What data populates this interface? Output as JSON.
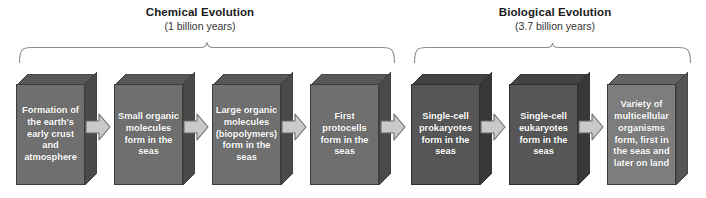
{
  "diagram": {
    "phases": [
      {
        "id": "chemical",
        "title": "Chemical Evolution",
        "duration": "(1 billion years)"
      },
      {
        "id": "biological",
        "title": "Biological Evolution",
        "duration": "(3.7 billion years)"
      }
    ],
    "steps": [
      {
        "index": 1,
        "label": "Formation of the earth's early crust and atmosphere",
        "phase": "chemical",
        "face_color": "#6f6f6f",
        "top_color": "#575757",
        "side_color": "#4a4a4a"
      },
      {
        "index": 2,
        "label": "Small organic molecules form in the seas",
        "phase": "chemical",
        "face_color": "#6f6f6f",
        "top_color": "#575757",
        "side_color": "#4a4a4a"
      },
      {
        "index": 3,
        "label": "Large organic molecules (biopolymers) form in the seas",
        "phase": "chemical",
        "face_color": "#6f6f6f",
        "top_color": "#575757",
        "side_color": "#4a4a4a"
      },
      {
        "index": 4,
        "label": "First protocells form in the seas",
        "phase": "chemical",
        "face_color": "#6f6f6f",
        "top_color": "#575757",
        "side_color": "#4a4a4a"
      },
      {
        "index": 5,
        "label": "Single-cell prokaryotes form in the seas",
        "phase": "biological",
        "face_color": "#565656",
        "top_color": "#434343",
        "side_color": "#383838"
      },
      {
        "index": 6,
        "label": "Single-cell eukaryotes form in the seas",
        "phase": "biological",
        "face_color": "#565656",
        "top_color": "#434343",
        "side_color": "#383838"
      },
      {
        "index": 7,
        "label": "Variety of multicellular organisms form, first in the seas and later on land",
        "phase": "biological",
        "face_color": "#7d7d7d",
        "top_color": "#636363",
        "side_color": "#555555"
      }
    ],
    "arrows": {
      "count": 6,
      "direction": "right",
      "fill_color": "#c9c9c9",
      "stroke_color": "#6a6a6a",
      "icon": "arrow-right-icon"
    },
    "brace_color": "#8c8c8c",
    "background_color": "#ffffff",
    "text_color": "#ffffff"
  }
}
